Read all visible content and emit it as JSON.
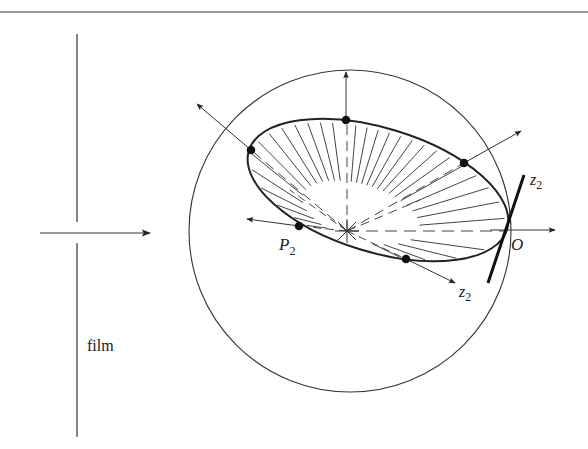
{
  "figure": {
    "type": "optics-geometry-diagram",
    "colors": {
      "ink": "#222222",
      "background": "#ffffff"
    },
    "top_rule": {
      "x1": 0,
      "x2": 588,
      "y": 12
    },
    "film": {
      "label": "film",
      "x": 77,
      "top_segment": [
        34,
        222
      ],
      "bottom_segment": [
        243,
        437
      ],
      "label_pos": [
        96,
        351
      ]
    },
    "incoming_ray": {
      "from": [
        40,
        233
      ],
      "to": [
        150,
        233
      ]
    },
    "sphere": {
      "cx": 350,
      "cy": 231,
      "r": 161
    },
    "ellipse": {
      "cx": 378,
      "cy": 190,
      "rx": 135,
      "ry": 62,
      "rotation_deg": 17
    },
    "center_star": {
      "x": 347,
      "y": 231
    },
    "points": [
      {
        "name": "upper-left",
        "x": 251,
        "y": 150,
        "arrow_to": [
          197,
          104
        ]
      },
      {
        "name": "top",
        "x": 346,
        "y": 120,
        "arrow_to": [
          346,
          72
        ]
      },
      {
        "name": "upper-right",
        "x": 464,
        "y": 163,
        "arrow_to": [
          521,
          131
        ]
      },
      {
        "name": "P2",
        "x": 299,
        "y": 226,
        "arrow_to": [
          247,
          219
        ]
      },
      {
        "name": "bottom",
        "x": 406,
        "y": 259,
        "arrow_to": [
          455,
          283
        ]
      }
    ],
    "origin": {
      "name": "O",
      "x": 505,
      "y": 230,
      "arrow_to": [
        555,
        230
      ]
    },
    "tangent_line": {
      "from": [
        524,
        175
      ],
      "to": [
        488,
        283
      ]
    },
    "labels": {
      "P2": {
        "text": "P",
        "sub": "2",
        "x": 279,
        "y": 250
      },
      "O": {
        "text": "O",
        "x": 511,
        "y": 250
      },
      "z2_upper": {
        "text": "z",
        "sub": "2",
        "x": 530,
        "y": 185
      },
      "z2_lower": {
        "text": "z",
        "sub": "2",
        "x": 459,
        "y": 297
      }
    }
  }
}
